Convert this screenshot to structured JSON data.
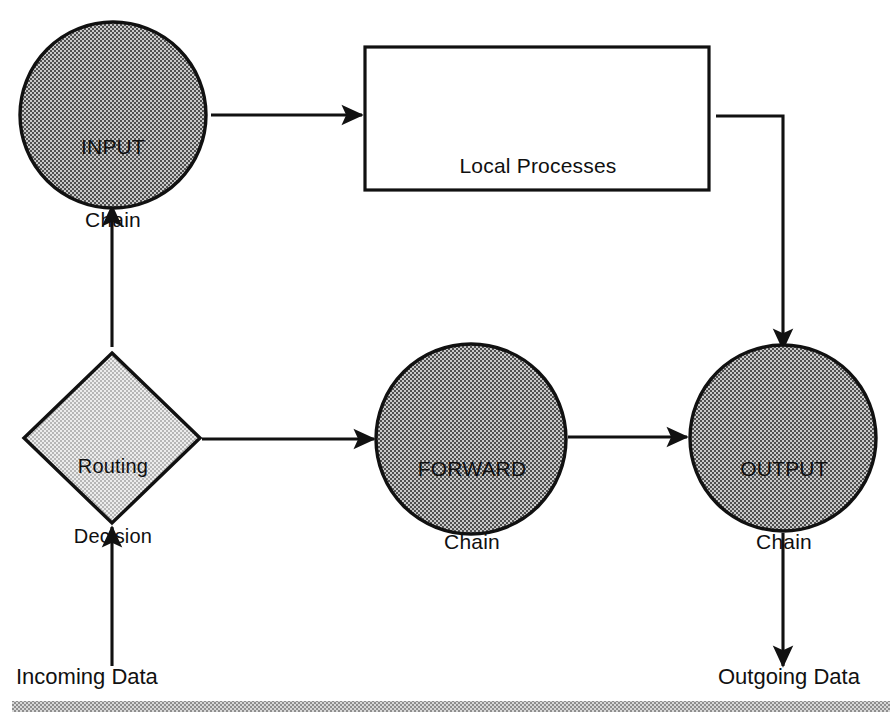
{
  "diagram": {
    "colors": {
      "circle_fill": "#9d9d9d",
      "diamond_fill": "#d6d6d6",
      "stroke": "#111111",
      "text": "#101010",
      "rule_bar": "#b4b4b4",
      "page_background": "#ffffff"
    },
    "nodes": {
      "input_chain": {
        "shape": "circle",
        "line1": "INPUT",
        "line2": "Chain",
        "cx": 113,
        "cy": 115,
        "r": 93
      },
      "local_processes": {
        "shape": "rectangle",
        "label": "Local Processes",
        "x": 365,
        "y": 47,
        "width": 344,
        "height": 143
      },
      "routing_decision": {
        "shape": "diamond",
        "line1": "Routing",
        "line2": "Decision",
        "cx": 112,
        "cy": 438,
        "half_width": 88,
        "half_height": 85
      },
      "forward_chain": {
        "shape": "circle",
        "line1": "FORWARD",
        "line2": "Chain",
        "cx": 471,
        "cy": 439,
        "r": 95
      },
      "output_chain": {
        "shape": "circle",
        "line1": "OUTPUT",
        "line2": "Chain",
        "cx": 783,
        "cy": 438,
        "r": 93
      }
    },
    "edge_labels": {
      "incoming": "Incoming Data",
      "outgoing": "Outgoing Data"
    },
    "connections": [
      {
        "name": "incoming-to-routing",
        "from": "Incoming Data",
        "to": "Routing Decision",
        "direction": "up"
      },
      {
        "name": "routing-to-input",
        "from": "Routing Decision",
        "to": "INPUT Chain",
        "direction": "up"
      },
      {
        "name": "input-to-local-processes",
        "from": "INPUT Chain",
        "to": "Local Processes",
        "direction": "right"
      },
      {
        "name": "local-processes-to-output",
        "from": "Local Processes",
        "to": "OUTPUT Chain",
        "direction": "elbow-right-down"
      },
      {
        "name": "routing-to-forward",
        "from": "Routing Decision",
        "to": "FORWARD Chain",
        "direction": "right"
      },
      {
        "name": "forward-to-output",
        "from": "FORWARD Chain",
        "to": "OUTPUT Chain",
        "direction": "right"
      },
      {
        "name": "output-to-outgoing",
        "from": "OUTPUT Chain",
        "to": "Outgoing Data",
        "direction": "down"
      }
    ],
    "footer_rule": {
      "x": 12,
      "y": 701,
      "width": 878,
      "height": 11
    }
  }
}
